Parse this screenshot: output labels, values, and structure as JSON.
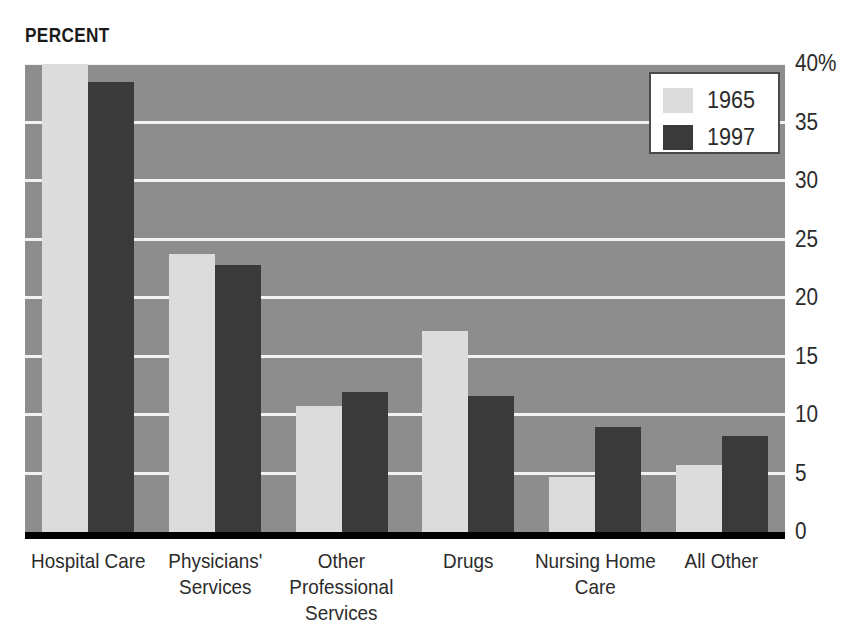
{
  "chart_data": {
    "type": "bar",
    "title": "",
    "xlabel": "",
    "ylabel": "PERCENT",
    "ylim": [
      0,
      40
    ],
    "yticks": [
      0,
      5,
      10,
      15,
      20,
      25,
      30,
      35,
      40
    ],
    "ytick_labels": [
      "0",
      "5",
      "10",
      "15",
      "20",
      "25",
      "30",
      "35",
      "40%"
    ],
    "grid": true,
    "legend_position": "top-right",
    "categories": [
      "Hospital Care",
      "Physicians'\nServices",
      "Other Professional\nServices",
      "Drugs",
      "Nursing Home\nCare",
      "All Other"
    ],
    "series": [
      {
        "name": "1965",
        "color": "#dcdcdc",
        "values": [
          40.0,
          23.8,
          10.8,
          17.2,
          4.7,
          5.7
        ]
      },
      {
        "name": "1997",
        "color": "#3a3a3a",
        "values": [
          38.5,
          22.8,
          12.0,
          11.6,
          9.0,
          8.2
        ]
      }
    ],
    "colors": {
      "plot_background": "#8d8d8d",
      "gridline": "#f2f2f2",
      "axis": "#000000",
      "text": "#2b2b2b",
      "series_1965": "#dcdcdc",
      "series_1997": "#3a3a3a"
    }
  }
}
